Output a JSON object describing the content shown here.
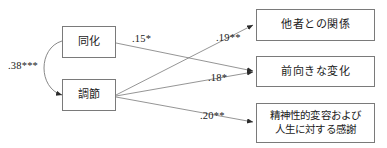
{
  "diagram": {
    "type": "path-diagram",
    "exogenous_nodes": [
      {
        "id": "assimilation",
        "label": "同化"
      },
      {
        "id": "accommodation",
        "label": "調節"
      }
    ],
    "endogenous_nodes": [
      {
        "id": "relations_with_others",
        "label": "他者との関係"
      },
      {
        "id": "positive_change",
        "label": "前向きな変化"
      },
      {
        "id": "spiritual_change",
        "label_line1": "精神性的変容および",
        "label_line2": "人生に対する感謝"
      }
    ],
    "covariance": {
      "from": "assimilation",
      "to": "accommodation",
      "label": ".38***"
    },
    "paths": [
      {
        "from": "assimilation",
        "to": "positive_change",
        "label": ".15*"
      },
      {
        "from": "accommodation",
        "to": "relations_with_others",
        "label": ".19**"
      },
      {
        "from": "accommodation",
        "to": "positive_change",
        "label": ".18*"
      },
      {
        "from": "accommodation",
        "to": "spiritual_change",
        "label": ".20**"
      }
    ],
    "colors": {
      "line": "#7a7a7a",
      "text": "#1a1a1a",
      "background": "#ffffff"
    }
  }
}
